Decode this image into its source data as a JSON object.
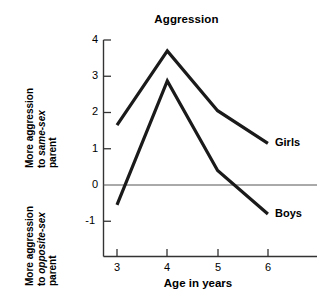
{
  "chart_data": {
    "type": "line",
    "title": "Aggression",
    "xlabel": "Age in years",
    "ylabel": "",
    "categories": [
      "3",
      "4",
      "5",
      "6"
    ],
    "x": [
      3,
      4,
      5,
      6
    ],
    "xlim": [
      2.5,
      6.6
    ],
    "ylim": [
      -1.6,
      4
    ],
    "yticks": [
      "4",
      "3",
      "2",
      "1",
      "0",
      "-1"
    ],
    "ytick_values": [
      4,
      3,
      2,
      1,
      0,
      -1
    ],
    "grid": false,
    "legend_position": "line-end-labels",
    "zero_line": true,
    "series": [
      {
        "name": "Girls",
        "values": [
          1.65,
          3.7,
          2.05,
          1.15
        ]
      },
      {
        "name": "Boys",
        "values": [
          -0.55,
          2.87,
          0.4,
          -0.8
        ]
      }
    ],
    "annotations": {
      "y_caption_upper_line1": "More aggression",
      "y_caption_upper_line2_prefix": "to ",
      "y_caption_upper_line2_italic": "same-sex",
      "y_caption_upper_line3": "parent",
      "y_caption_lower_line1": "More aggression",
      "y_caption_lower_line2_prefix": "to ",
      "y_caption_lower_line2_italic": "opposite-sex",
      "y_caption_lower_line3": "parent"
    }
  },
  "chart": {
    "title": "Aggression",
    "x_axis_title": "Age in years",
    "x_tick_labels": [
      "3",
      "4",
      "5",
      "6"
    ],
    "y_tick_labels": [
      "4",
      "3",
      "2",
      "1",
      "0",
      "-1"
    ],
    "series_labels": {
      "girls": "Girls",
      "boys": "Boys"
    },
    "y_caption_upper": {
      "line1": "More aggression",
      "line2_prefix": "to ",
      "line2_italic": "same-sex",
      "line3": "parent"
    },
    "y_caption_lower": {
      "line1": "More aggression",
      "line2_prefix": "to ",
      "line2_italic": "opposite-sex",
      "line3": "parent"
    },
    "colors": {
      "line": "#1a1a1a",
      "axis": "#333333",
      "zero_line": "#555555",
      "background": "#ffffff"
    }
  }
}
